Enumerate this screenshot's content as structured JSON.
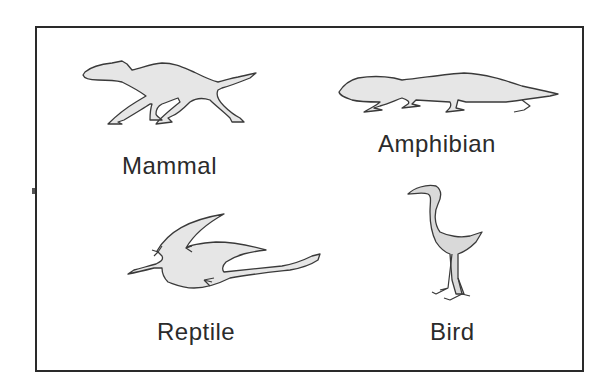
{
  "diagram": {
    "type": "classification-panel",
    "animals": [
      {
        "id": "mammal",
        "label": "Mammal",
        "icon": "mammal-silhouette-icon"
      },
      {
        "id": "amphibian",
        "label": "Amphibian",
        "icon": "amphibian-silhouette-icon"
      },
      {
        "id": "reptile",
        "label": "Reptile",
        "icon": "pterosaur-silhouette-icon"
      },
      {
        "id": "bird",
        "label": "Bird",
        "icon": "bird-silhouette-icon"
      }
    ],
    "colors": {
      "fill": "#e6e6e6",
      "outline": "#3a3a3a",
      "text": "#2b2b2b",
      "frame": "#2a2a2a"
    }
  }
}
